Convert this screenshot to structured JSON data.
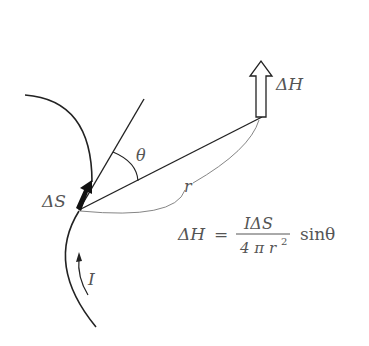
{
  "diagram": {
    "labels": {
      "delta_s": "ΔS",
      "delta_h": "ΔH",
      "theta": "θ",
      "r": "r",
      "current": "I"
    },
    "formula": {
      "lhs": "ΔH",
      "equals": "=",
      "numerator": "IΔS",
      "denominator_prefix": "4 π r",
      "denominator_exp": "2",
      "suffix": "sinθ"
    },
    "colors": {
      "line": "#222222",
      "thin_line": "#777777",
      "text": "#555555"
    }
  }
}
